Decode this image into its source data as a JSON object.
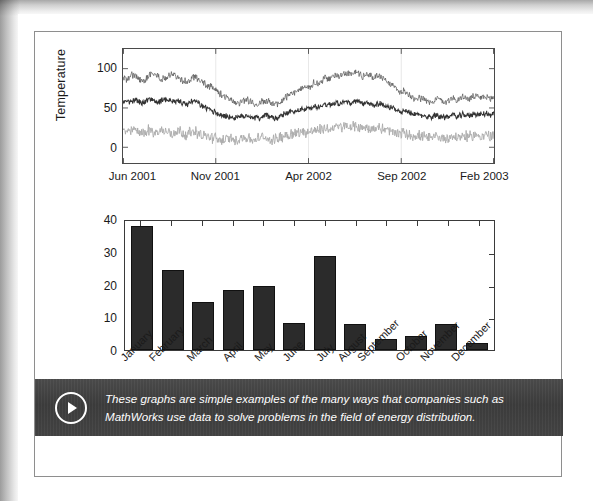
{
  "caption": {
    "icon": "play-circle-icon",
    "text": "These graphs are simple examples of the many ways that companies such as MathWorks use data to solve problems in the field of energy distribution."
  },
  "chart_data": [
    {
      "type": "line",
      "title": "",
      "xlabel": "",
      "ylabel": "Temperature",
      "ylim": [
        -20,
        125
      ],
      "yticks": [
        0,
        50,
        100
      ],
      "xtick_labels": [
        "Jun 2001",
        "Nov 2001",
        "Apr 2002",
        "Sep 2002",
        "Feb 2003"
      ],
      "grid": true,
      "legend": "none",
      "series": [
        {
          "name": "maximum-temperature",
          "color": "#555555",
          "width": 0.7,
          "noise": 3.5,
          "values": [
            88,
            86,
            90,
            93,
            88,
            84,
            87,
            91,
            95,
            92,
            88,
            86,
            90,
            94,
            91,
            88,
            85,
            83,
            86,
            90,
            88,
            84,
            80,
            78,
            75,
            72,
            68,
            64,
            62,
            60,
            58,
            57,
            59,
            61,
            58,
            56,
            55,
            57,
            60,
            58,
            56,
            55,
            57,
            62,
            66,
            70,
            68,
            72,
            76,
            74,
            78,
            82,
            80,
            84,
            88,
            86,
            90,
            93,
            91,
            95,
            94,
            92,
            96,
            94,
            90,
            93,
            91,
            88,
            92,
            90,
            86,
            82,
            78,
            74,
            70,
            72,
            68,
            65,
            62,
            64,
            61,
            59,
            57,
            60,
            62,
            59,
            57,
            61,
            63,
            60,
            62,
            64,
            61,
            63,
            65,
            62,
            64,
            63,
            61,
            64
          ]
        },
        {
          "name": "mean-temperature",
          "color": "#333333",
          "width": 1.0,
          "noise": 3.0,
          "values": [
            58,
            60,
            57,
            61,
            59,
            56,
            58,
            62,
            60,
            57,
            59,
            61,
            58,
            60,
            57,
            59,
            56,
            54,
            57,
            59,
            56,
            53,
            50,
            48,
            46,
            44,
            42,
            40,
            39,
            38,
            37,
            38,
            40,
            41,
            39,
            38,
            37,
            39,
            41,
            39,
            38,
            37,
            39,
            42,
            44,
            46,
            45,
            47,
            49,
            48,
            50,
            52,
            51,
            53,
            55,
            54,
            56,
            57,
            56,
            58,
            57,
            56,
            58,
            57,
            55,
            56,
            55,
            54,
            56,
            55,
            53,
            51,
            49,
            47,
            45,
            46,
            44,
            43,
            41,
            42,
            40,
            39,
            38,
            40,
            41,
            39,
            38,
            40,
            41,
            39,
            40,
            42,
            40,
            41,
            43,
            41,
            42,
            43,
            41,
            43
          ]
        },
        {
          "name": "minimum-temperature",
          "color": "#aaaaaa",
          "width": 0.9,
          "noise": 5.5,
          "values": [
            20,
            22,
            18,
            24,
            19,
            21,
            17,
            23,
            20,
            18,
            22,
            19,
            21,
            17,
            20,
            22,
            18,
            16,
            19,
            21,
            18,
            16,
            14,
            13,
            12,
            11,
            10,
            9,
            11,
            10,
            9,
            11,
            13,
            12,
            10,
            9,
            11,
            13,
            12,
            10,
            9,
            11,
            13,
            15,
            16,
            18,
            17,
            19,
            20,
            19,
            21,
            22,
            21,
            23,
            24,
            23,
            25,
            26,
            25,
            27,
            26,
            25,
            27,
            26,
            24,
            25,
            24,
            23,
            25,
            24,
            22,
            21,
            19,
            18,
            17,
            18,
            16,
            15,
            14,
            15,
            13,
            12,
            11,
            13,
            14,
            12,
            11,
            13,
            14,
            12,
            13,
            15,
            13,
            14,
            16,
            14,
            15,
            16,
            14,
            16
          ]
        }
      ]
    },
    {
      "type": "bar",
      "title": "",
      "xlabel": "",
      "ylabel": "",
      "ylim": [
        0,
        40
      ],
      "yticks": [
        0,
        10,
        20,
        30,
        40
      ],
      "categories": [
        "January",
        "February",
        "March",
        "April",
        "May",
        "June",
        "July",
        "August",
        "September",
        "October",
        "November",
        "December"
      ],
      "values": [
        37.8,
        24.5,
        14.8,
        18.2,
        19.6,
        8.2,
        28.8,
        8.0,
        3.4,
        4.2,
        8.0,
        2.1
      ],
      "bar_color": "#2b2b2b",
      "grid": false,
      "legend": "none"
    }
  ]
}
